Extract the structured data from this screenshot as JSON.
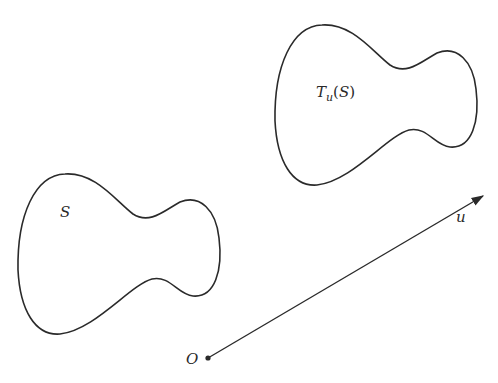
{
  "figure": {
    "labels": {
      "region": "S",
      "translated_T": "T",
      "translated_sub": "u",
      "translated_arg_open": "(",
      "translated_arg": "S",
      "translated_arg_close": ")",
      "vector": "u",
      "origin": "O"
    },
    "vector": {
      "from": [
        208,
        358
      ],
      "to": [
        484,
        195
      ]
    },
    "translation_offset": [
      257,
      -149
    ],
    "stroke_color": "#2a2a2a"
  }
}
